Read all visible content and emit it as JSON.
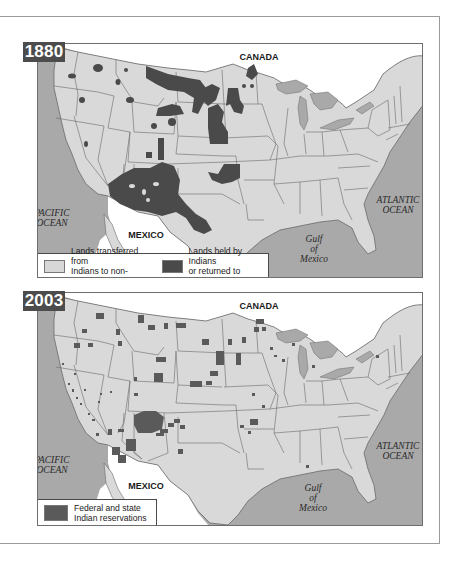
{
  "maps": [
    {
      "year": "1880",
      "labels": {
        "canada": "CANADA",
        "mexico": "MEXICO",
        "pacific": [
          "PACIFIC",
          "OCEAN"
        ],
        "atlantic": [
          "ATLANTIC",
          "OCEAN"
        ],
        "gulf": [
          "Gulf",
          "of",
          "Mexico"
        ]
      },
      "legend": [
        {
          "swatch": "light-gray",
          "color": "#d7d7d7",
          "line1": "Lands transferred from",
          "line2": "Indians to non-Indians"
        },
        {
          "swatch": "dark-gray",
          "color": "#4a4a4a",
          "line1": "Lands held by Indians",
          "line2": "or returned to Indians"
        }
      ]
    },
    {
      "year": "2003",
      "labels": {
        "canada": "CANADA",
        "mexico": "MEXICO",
        "pacific": [
          "PACIFIC",
          "OCEAN"
        ],
        "atlantic": [
          "ATLANTIC",
          "OCEAN"
        ],
        "gulf": [
          "Gulf",
          "of",
          "Mexico"
        ]
      },
      "legend": [
        {
          "swatch": "mid-dark-gray",
          "color": "#5a5a5a",
          "line1": "Federal and state",
          "line2": "Indian reservations"
        }
      ]
    }
  ],
  "colors": {
    "land": "#d9d9d9",
    "water": "#a9a9a9",
    "indian_land": "#4a4a4a",
    "foreign_land": "#ffffff",
    "borders": "#6a6a6a",
    "badge": "#4c4c4c"
  }
}
